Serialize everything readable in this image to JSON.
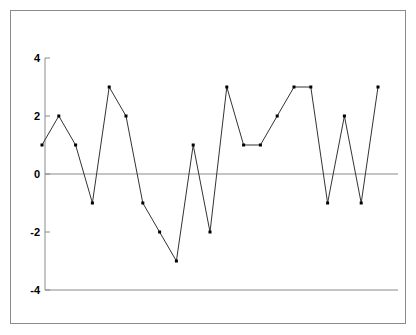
{
  "chart_data": {
    "type": "line",
    "title": "",
    "subtitle": "",
    "xlabel": "",
    "ylabel": "",
    "x": [
      1,
      2,
      3,
      4,
      5,
      6,
      7,
      8,
      9,
      10,
      11,
      12,
      13,
      14,
      15,
      16,
      17,
      18,
      19,
      20,
      21
    ],
    "values": [
      1,
      2,
      1,
      -1,
      3,
      2,
      -1,
      -2,
      -3,
      1,
      -2,
      3,
      1,
      1,
      2,
      3,
      3,
      -1,
      2,
      -1,
      3
    ],
    "series": [
      {
        "name": "series-1",
        "values": [
          1,
          2,
          1,
          -1,
          3,
          2,
          -1,
          -2,
          -3,
          1,
          -2,
          3,
          1,
          1,
          2,
          3,
          3,
          -1,
          2,
          -1,
          3
        ]
      }
    ],
    "ylim": [
      -4,
      4
    ],
    "xlim": [
      0.5,
      21.5
    ],
    "yticks": [
      4,
      2,
      0,
      -2,
      -4
    ],
    "ytick_labels": [
      "4",
      "2",
      "0",
      "-2",
      "-4"
    ],
    "xticks": [],
    "xtick_labels": [],
    "grid": false,
    "legend": false,
    "legend_position": "none",
    "annotations": [],
    "reference_lines": [
      {
        "name": "zero-line",
        "value": 0
      },
      {
        "name": "lower-bound-line",
        "value": -4
      }
    ],
    "style": {
      "line_color": "#333333",
      "marker_color": "#000000",
      "axis_color": "#8a8a8a",
      "frame_color": "#8a8a8a",
      "background": "#ffffff",
      "marker": "square",
      "line_width": 1
    }
  }
}
